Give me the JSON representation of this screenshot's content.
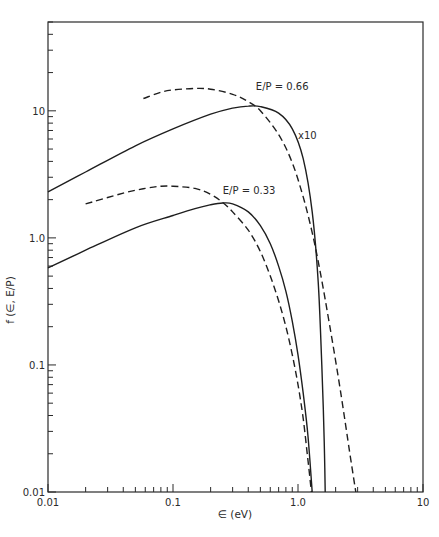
{
  "chart_data": {
    "type": "line",
    "title": "",
    "xlabel": "∈ (eV)",
    "ylabel": "f (∈, E/P)",
    "xscale": "log",
    "yscale": "log",
    "xlim": [
      0.01,
      10
    ],
    "ylim": [
      0.01,
      50
    ],
    "grid": false,
    "x_tick_labels": [
      {
        "value": 0.01,
        "label": "0.01"
      },
      {
        "value": 0.1,
        "label": "0.1"
      },
      {
        "value": 1.0,
        "label": "1.0"
      },
      {
        "value": 10,
        "label": "10"
      }
    ],
    "y_tick_labels": [
      {
        "value": 0.01,
        "label": "0.01"
      },
      {
        "value": 0.1,
        "label": "0.1"
      },
      {
        "value": 1.0,
        "label": "1.0"
      },
      {
        "value": 10,
        "label": "10"
      }
    ],
    "series": [
      {
        "name": "E/P = 0.66 solid (x10)",
        "style": "solid",
        "x": [
          0.01,
          0.02,
          0.05,
          0.1,
          0.2,
          0.3,
          0.4,
          0.5,
          0.7,
          0.9,
          1.1,
          1.3,
          1.45,
          1.55,
          1.6,
          1.63,
          1.65
        ],
        "y": [
          2.3,
          3.3,
          5.3,
          7.2,
          9.4,
          10.5,
          10.9,
          10.8,
          9.6,
          7.2,
          4.2,
          1.6,
          0.45,
          0.1,
          0.04,
          0.02,
          0.01
        ]
      },
      {
        "name": "E/P = 0.66 dashed",
        "style": "dashed",
        "x": [
          0.058,
          0.08,
          0.1,
          0.15,
          0.2,
          0.3,
          0.4,
          0.5,
          0.7,
          0.9,
          1.1,
          1.3,
          1.5,
          1.8,
          2.2,
          2.6,
          2.9
        ],
        "y": [
          12.5,
          14.0,
          14.6,
          15.0,
          14.8,
          13.5,
          11.8,
          10.0,
          6.5,
          3.9,
          2.1,
          1.1,
          0.55,
          0.2,
          0.06,
          0.02,
          0.01
        ]
      },
      {
        "name": "E/P = 0.33 solid",
        "style": "solid",
        "x": [
          0.01,
          0.02,
          0.05,
          0.1,
          0.15,
          0.2,
          0.25,
          0.3,
          0.4,
          0.5,
          0.6,
          0.7,
          0.8,
          0.9,
          1.0,
          1.1,
          1.2,
          1.3
        ],
        "y": [
          0.58,
          0.8,
          1.2,
          1.5,
          1.7,
          1.82,
          1.88,
          1.85,
          1.6,
          1.25,
          0.9,
          0.6,
          0.38,
          0.22,
          0.12,
          0.06,
          0.028,
          0.01
        ]
      },
      {
        "name": "E/P = 0.33 dashed",
        "style": "dashed",
        "x": [
          0.02,
          0.04,
          0.06,
          0.08,
          0.1,
          0.15,
          0.2,
          0.25,
          0.3,
          0.4,
          0.5,
          0.6,
          0.7,
          0.8,
          0.9,
          1.0,
          1.1,
          1.2,
          1.28
        ],
        "y": [
          1.85,
          2.25,
          2.45,
          2.55,
          2.55,
          2.45,
          2.2,
          1.9,
          1.6,
          1.15,
          0.78,
          0.5,
          0.32,
          0.2,
          0.12,
          0.07,
          0.038,
          0.018,
          0.01
        ]
      }
    ],
    "annotations": [
      {
        "text": "E/P = 0.66",
        "x": 0.46,
        "y": 14.5
      },
      {
        "text": "x10",
        "x": 1.0,
        "y": 6.0
      },
      {
        "text": "E/P = 0.33",
        "x": 0.25,
        "y": 2.2
      }
    ]
  }
}
